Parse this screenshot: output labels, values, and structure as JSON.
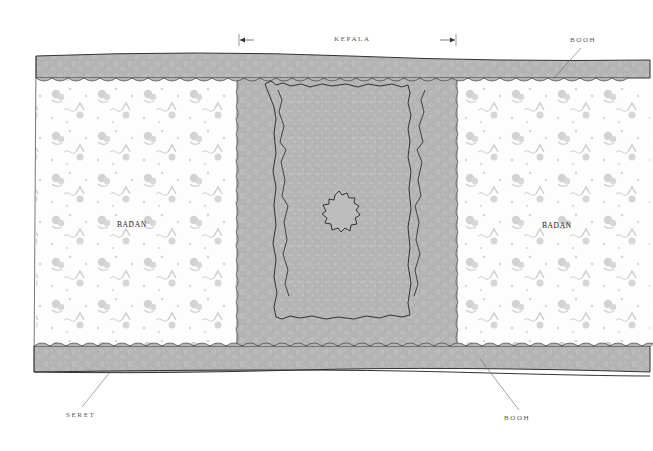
{
  "diagram": {
    "labels": {
      "kepala": "KEPALA",
      "booh_top": "BOOH",
      "booh_bottom": "BOOH",
      "seret": "SERET",
      "badan_left": "BADAN",
      "badan_right": "BADAN"
    },
    "colors": {
      "border_band": "#b9b9b9",
      "border_band_dark": "#a8a8a8",
      "kepala_field": "#b3b3b3",
      "kepala_edge": "#c4c4c4",
      "badan_ground": "#fbfbfb",
      "motif": "#c9c9c9",
      "outline": "#333333",
      "leader_line": "#666666"
    }
  }
}
